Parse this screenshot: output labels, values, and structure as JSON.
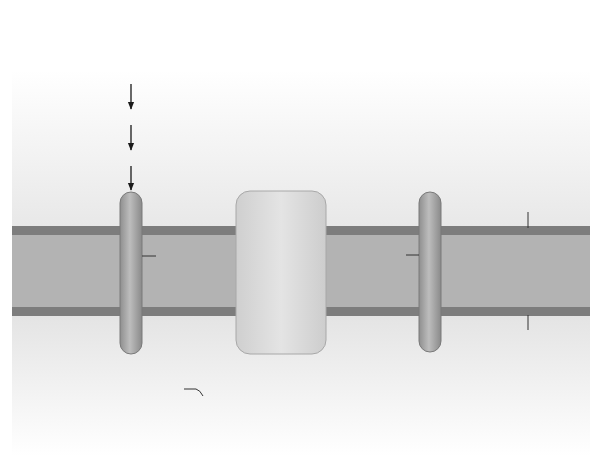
{
  "regions": {
    "cytosol": "Cytosol",
    "outer_membrane": "Outer mitochondrial membrane",
    "outer_membrane_l1": "Outer mitochondrial",
    "outer_membrane_l2": "membrane",
    "intermembrane": "Intermembrane space",
    "inner_membrane_l1": "Inner mitochondrial",
    "inner_membrane_l2": "membrane",
    "mitochondrion": "Mitochondrion"
  },
  "cytosol_nodes": {
    "glucose": "Glucose",
    "glycolysis": "Glycolysis",
    "pyruvate_left": "Pyruvate",
    "citrate": "Citrate",
    "citrate_lyase_l1": "Citrate",
    "citrate_lyase_l2": "lyase",
    "acetyl_coa": "Acetyl-CoA",
    "acc": "ACC",
    "malonyl_coa": "Malonyl-CoA",
    "palmitate_l1": "Palmitate",
    "palmitate_l2": "(lipogenesis)",
    "oxaloacetate": "Oxaloacetate",
    "cyto_mdh_l1": "Cytosolic",
    "cyto_mdh_l2": "malate",
    "cyto_mdh_l3": "dehydrogenase",
    "malate": "Malate",
    "pyruvate_right": "Pyruvate",
    "gluconeogenesis": "Gluconeogenesis"
  },
  "transporters": {
    "left": "Transporter",
    "middle_l1": "Malate-citrate",
    "middle_l2": "transporter",
    "right": "Transporter"
  },
  "mito_nodes": {
    "citrate": "Citrate",
    "malate": "Malate",
    "tca_cycle": "TCA cycle",
    "citrate_synthase_l1": "Citrate",
    "citrate_synthase_l2": "synthase",
    "mito_mdh_l1": "Mitochondrial",
    "mito_mdh_l2": "malate dehydrogenase",
    "acetyl_coa": "Acetyl-CoA",
    "oxaloacetate": "Oxaloacetate",
    "pdc": "PDC",
    "pc": "PC",
    "pyruvate": "Pyruvate"
  },
  "colors": {
    "membrane_dark": "#7d7d7d",
    "intermembrane": "#b3b3b3",
    "box": "#b9b9b9",
    "box_light": "#d4d4d4",
    "arrow": "#1a1a1a"
  }
}
